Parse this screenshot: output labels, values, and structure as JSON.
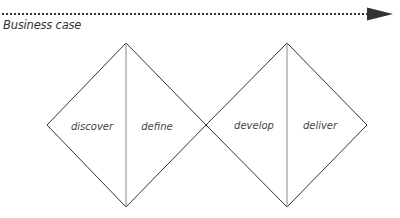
{
  "diagram": {
    "timeline": {
      "label": "Business case",
      "style": "dotted-arrow",
      "color": "#333333"
    },
    "diamonds": [
      {
        "name": "problem-diamond",
        "phases": [
          {
            "label": "discover"
          },
          {
            "label": "define"
          }
        ]
      },
      {
        "name": "solution-diamond",
        "phases": [
          {
            "label": "develop"
          },
          {
            "label": "deliver"
          }
        ]
      }
    ],
    "colors": {
      "line": "#333333",
      "divider": "#888888",
      "text": "#444444"
    }
  }
}
